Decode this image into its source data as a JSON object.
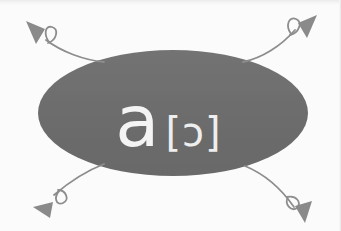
{
  "figure": {
    "type": "linguistic-diagram",
    "background_color": "#fbfbfb",
    "ellipse": {
      "label": "grapheme-phoneme-ellipse",
      "fill_color": "#6e6e6e",
      "center_x": 173,
      "center_y": 113,
      "radius_x": 135,
      "radius_y": 63
    },
    "content": {
      "grapheme": "a",
      "transcription": "[ɔ]",
      "transcription_open": "[",
      "transcription_symbol": "ɔ",
      "transcription_close": "]",
      "text_color": "#f4f4f4"
    },
    "arrow_color": "#8d8d8d",
    "arrows": [
      {
        "name": "arrow-top-left",
        "direction": "up-left",
        "has_loop": true,
        "path": "M 104 62 C 84 60, 62 52, 46 40",
        "loop": "M 50 43 C 44 34, 46 26, 52 28 C 58 30, 56 40, 49 43",
        "head": "M 27 22 L 44 30 L 36 43 Z"
      },
      {
        "name": "arrow-top-right",
        "direction": "up-right",
        "has_loop": true,
        "path": "M 243 62 C 262 58, 281 46, 295 30",
        "loop": "M 291 34 C 286 25, 290 17, 296 20 C 302 23, 298 33, 291 35",
        "head": "M 316 16 L 299 24 L 307 37 Z"
      },
      {
        "name": "arrow-bottom-left",
        "direction": "down-left",
        "has_loop": true,
        "path": "M 104 164 C 86 170, 68 182, 54 194",
        "loop": "M 60 190 C 54 197, 57 205, 63 203 C 69 200, 66 191, 59 190",
        "head": "M 34 206 L 52 202 L 50 217 Z"
      },
      {
        "name": "arrow-bottom-right",
        "direction": "down-right",
        "has_loop": true,
        "path": "M 245 166 C 262 172, 280 186, 294 206",
        "loop": "M 288 198 C 296 196, 301 202, 297 207 C 292 211, 285 205, 288 198",
        "head": "M 306 222 L 296 207 L 311 202 Z"
      }
    ]
  }
}
